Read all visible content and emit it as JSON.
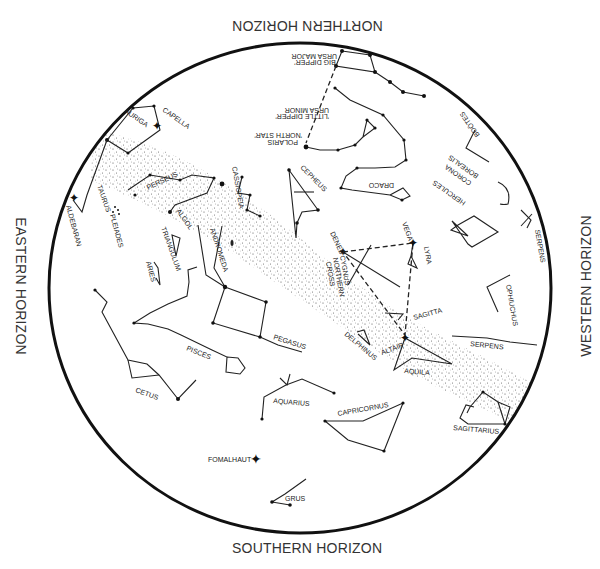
{
  "horizons": {
    "north": "NORTHERN HORIZON",
    "south": "SOUTHERN HORIZON",
    "east": "EASTERN HORIZON",
    "west": "WESTERN HORIZON"
  },
  "labels": {
    "ursa_major": "URSA MAJOR",
    "big_dipper": "'BIG DIPPER'",
    "ursa_minor": "URSA MINOR",
    "little_dipper": "'LITTLE DIPPER'",
    "polaris": "POLARIS",
    "north_star": "'NORTH STAR'",
    "draco": "DRACO",
    "cepheus": "CEPHEUS",
    "cassiopeia": "CASSIOPEIA",
    "perseus": "PERSEUS",
    "algol": "ALGOL",
    "auriga": "AURIGA",
    "capella": "CAPELLA",
    "taurus": "TAURUS",
    "aldebaran": "ALDEBARAN",
    "pleiades": "PLEIADES",
    "triangulum": "TRIANGULUM",
    "aries": "ARIES",
    "andromeda": "ANDROMEDA",
    "pegasus": "PEGASUS",
    "pisces": "PISCES",
    "cetus": "CETUS",
    "aquarius": "AQUARIUS",
    "capricornus": "CAPRICORNUS",
    "fomalhaut": "FOMALHAUT",
    "grus": "GRUS",
    "deneb": "DENEB",
    "cygnus": "CYGNUS",
    "northern": "NORTHERN",
    "cross": "CROSS",
    "vega": "VEGA",
    "lyra": "LYRA",
    "sagitta": "SAGITTA",
    "delphinus": "DELPHINUS",
    "altair": "ALTAIR",
    "aquila": "AQUILA",
    "serpens_1": "SERPENS",
    "serpens_2": "SERPENS",
    "ophiuchus": "OPHIUCHUS",
    "hercules": "HERCULES",
    "corona": "CORONA",
    "borealis": "BOREALIS",
    "bootes": "BOÖTES",
    "sagittarius": "SAGITTARIUS"
  }
}
